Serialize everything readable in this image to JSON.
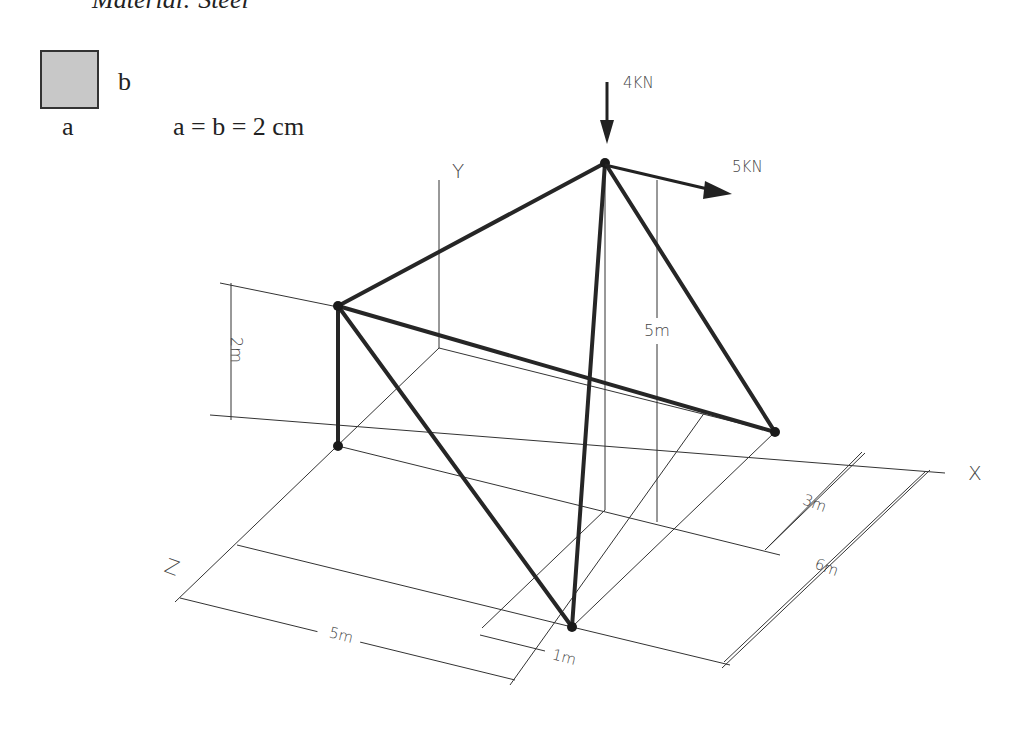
{
  "header": {
    "material_text": "Material: Steel"
  },
  "cross_section": {
    "label_a": "a",
    "label_b": "b",
    "dimension_text": "a = b = 2 cm",
    "fill_color": "#c8c8c8"
  },
  "loads": {
    "vertical": {
      "label": "4KN",
      "direction": "down"
    },
    "horizontal": {
      "label": "5KN",
      "direction": "+x"
    }
  },
  "axes": {
    "x": "X",
    "y": "Y",
    "z": "Z"
  },
  "dimensions": {
    "height_left": "2m",
    "height_apex": "5m",
    "x_offset_3": "3m",
    "x_offset_6": "6m",
    "z_length_5": "5m",
    "z_offset_1": "1m"
  },
  "colors": {
    "member": "#262626",
    "line": "#333333",
    "background": "#ffffff"
  }
}
